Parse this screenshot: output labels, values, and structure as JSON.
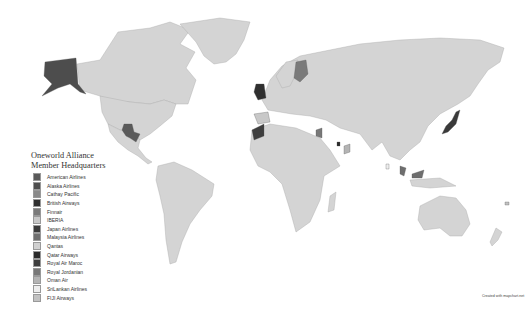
{
  "map": {
    "type": "choropleth",
    "projection": "robinson-like",
    "background": "#ffffff",
    "default_land_color": "#d4d4d4",
    "border_color": "#a9a9a9"
  },
  "legend": {
    "title_line1": "Oneworld Alliance",
    "title_line2": "Member Headquarters",
    "items": [
      {
        "label": "American Airlines",
        "color": "#5a5a5a",
        "region": "Texas, USA"
      },
      {
        "label": "Alaska Airlines",
        "color": "#4d4d4d",
        "region": "Alaska / Washington, USA"
      },
      {
        "label": "Cathay Pacific",
        "color": "#8a8a8a",
        "region": "Hong Kong"
      },
      {
        "label": "British Airways",
        "color": "#2f2f2f",
        "region": "United Kingdom"
      },
      {
        "label": "Finnair",
        "color": "#7a7a7a",
        "region": "Finland"
      },
      {
        "label": "IBERIA",
        "color": "#c8c8c8",
        "region": "Spain"
      },
      {
        "label": "Japan Airlines",
        "color": "#3a3a3a",
        "region": "Japan"
      },
      {
        "label": "Malaysia Airlines",
        "color": "#6e6e6e",
        "region": "Malaysia"
      },
      {
        "label": "Qantas",
        "color": "#d0d0d0",
        "region": "Australia"
      },
      {
        "label": "Qatar Airways",
        "color": "#2a2a2a",
        "region": "Qatar"
      },
      {
        "label": "Royal Air Maroc",
        "color": "#3e3e3e",
        "region": "Morocco"
      },
      {
        "label": "Royal Jordanian",
        "color": "#787878",
        "region": "Jordan"
      },
      {
        "label": "Oman Air",
        "color": "#b4b4b4",
        "region": "Oman"
      },
      {
        "label": "SriLankan Airlines",
        "color": "#eeeeee",
        "region": "Sri Lanka"
      },
      {
        "label": "FIJI Airways",
        "color": "#c2c2c2",
        "region": "Fiji"
      }
    ]
  },
  "credit": "Created with mapchart.net"
}
